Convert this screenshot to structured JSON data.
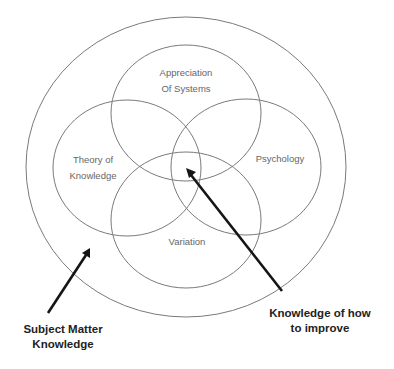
{
  "diagram": {
    "type": "venn",
    "outer_region": {
      "label_lines": [
        "Subject Matter",
        "Knowledge"
      ]
    },
    "circles": [
      {
        "id": "systems",
        "label_lines": [
          "Appreciation",
          "Of Systems"
        ]
      },
      {
        "id": "knowledge",
        "label_lines": [
          "Theory of",
          "Knowledge"
        ]
      },
      {
        "id": "psychology",
        "label_lines": [
          "Psychology"
        ]
      },
      {
        "id": "variation",
        "label_lines": [
          "Variation"
        ]
      }
    ],
    "center_callout": {
      "label_lines": [
        "Knowledge of how",
        "to improve"
      ]
    },
    "colors": {
      "circle_stroke": "#7a7a7a",
      "arrow": "#151515",
      "small_text": "#666666",
      "callout_text": "#222222",
      "background": "#ffffff"
    }
  }
}
